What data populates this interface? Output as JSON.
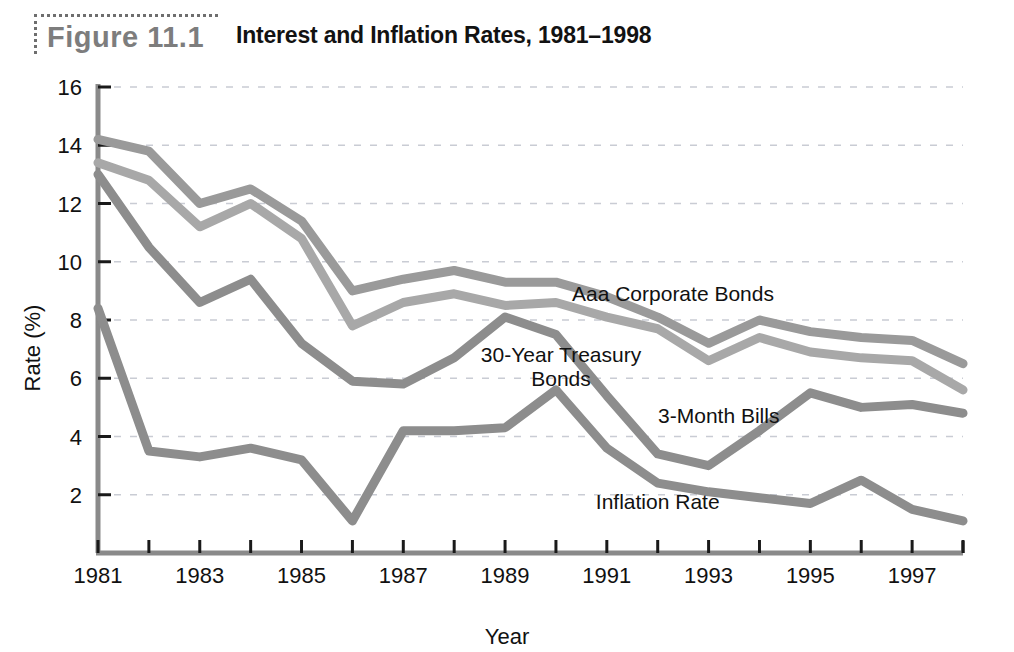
{
  "figure": {
    "badge_label": "Figure 11.1",
    "title": "Interest and Inflation Rates, 1981–1998"
  },
  "chart_data": {
    "type": "line",
    "title": "Interest and Inflation Rates, 1981–1998",
    "xlabel": "Year",
    "ylabel": "Rate (%)",
    "xlim": [
      1981,
      1998
    ],
    "ylim": [
      0,
      16
    ],
    "grid": true,
    "legend_position": "inline-annotations",
    "x": [
      1981,
      1982,
      1983,
      1984,
      1985,
      1986,
      1987,
      1988,
      1989,
      1990,
      1991,
      1992,
      1993,
      1994,
      1995,
      1996,
      1997,
      1998
    ],
    "xtick_labels": [
      "1981",
      "1983",
      "1985",
      "1987",
      "1989",
      "1991",
      "1993",
      "1995",
      "1997"
    ],
    "xtick_values": [
      1981,
      1983,
      1985,
      1987,
      1989,
      1991,
      1993,
      1995,
      1997
    ],
    "ytick_labels": [
      "2",
      "4",
      "6",
      "8",
      "10",
      "12",
      "14",
      "16"
    ],
    "ytick_values": [
      2,
      4,
      6,
      8,
      10,
      12,
      14,
      16
    ],
    "series": [
      {
        "name": "Aaa Corporate Bonds",
        "color": "#9a9a9a",
        "label_x": 1992.3,
        "label_y": 8.65,
        "values": [
          14.2,
          13.8,
          12.0,
          12.5,
          11.4,
          9.0,
          9.4,
          9.7,
          9.3,
          9.3,
          8.8,
          8.1,
          7.2,
          8.0,
          7.6,
          7.4,
          7.3,
          6.5
        ]
      },
      {
        "name": "30-Year Treasury Bonds",
        "color": "#a8a8a8",
        "label_x": 1990.1,
        "label_y": 6.55,
        "label_line2_y": 5.75,
        "values": [
          13.4,
          12.8,
          11.2,
          12.0,
          10.8,
          7.8,
          8.6,
          8.9,
          8.5,
          8.6,
          8.1,
          7.7,
          6.6,
          7.4,
          6.9,
          6.7,
          6.6,
          5.6
        ]
      },
      {
        "name": "3-Month Bills",
        "color": "#8d8d8d",
        "label_x": 1993.2,
        "label_y": 4.45,
        "values": [
          13.0,
          10.5,
          8.6,
          9.4,
          7.2,
          5.9,
          5.8,
          6.7,
          8.1,
          7.5,
          5.4,
          3.4,
          3.0,
          4.2,
          5.5,
          5.0,
          5.1,
          4.8
        ]
      },
      {
        "name": "Inflation Rate",
        "color": "#8d8d8d",
        "label_x": 1992.0,
        "label_y": 1.5,
        "values": [
          8.4,
          3.5,
          3.3,
          3.6,
          3.2,
          1.1,
          4.2,
          4.2,
          4.3,
          5.6,
          3.6,
          2.4,
          2.1,
          1.9,
          1.7,
          2.5,
          1.5,
          1.1
        ]
      }
    ]
  }
}
